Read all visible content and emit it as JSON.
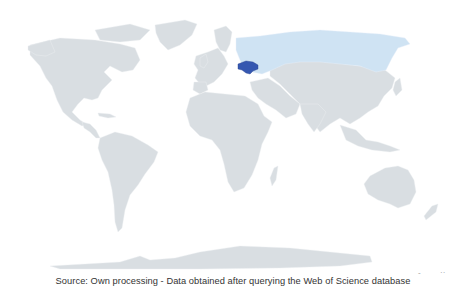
{
  "map": {
    "type": "choropleth-world",
    "projection": "equirectangular-like",
    "colors": {
      "background": "#ffffff",
      "land_default": "#d9dee2",
      "border": "#eef1f3",
      "highlight_high": "#3557b0",
      "highlight_low": "#cfe3f3"
    },
    "regions": [
      {
        "name": "Ukraine",
        "level": "high",
        "color": "#3557b0"
      },
      {
        "name": "Russia",
        "level": "low",
        "color": "#cfe3f3"
      }
    ],
    "legend": null
  },
  "caption": "Source: Own processing - Data obtained after querying the Web of Science database",
  "stray_marks": [
    "-",
    "··"
  ]
}
